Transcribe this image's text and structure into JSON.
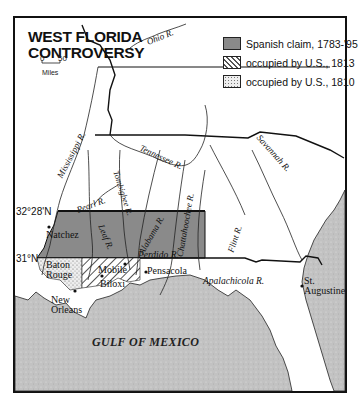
{
  "title": {
    "line1": "WEST FLORIDA",
    "line2": "CONTROVERSY"
  },
  "scale": {
    "zero": "0",
    "fifty": "50",
    "unit": "Miles"
  },
  "legend": [
    {
      "label": "Spanish claim, 1783-'95",
      "pattern": "solid-gray",
      "color": "#8a8a8a"
    },
    {
      "label": "occupied by U.S., 1813",
      "pattern": "diagonal-hatch",
      "color": "#ffffff"
    },
    {
      "label": "occupied by U.S., 1810",
      "pattern": "stipple",
      "color": "#e0e0e0"
    }
  ],
  "latitudes": [
    "32°28'N",
    "31°N"
  ],
  "rivers": [
    "Ohio R.",
    "Mississippi R.",
    "Tennessee R.",
    "Savannah R.",
    "Pearl R.",
    "Tombigbee R.",
    "Leaf R.",
    "Alabama R.",
    "Chattahoochee R.",
    "Flint R.",
    "Perdido R.",
    "Apalachicola R."
  ],
  "cities": [
    "Natchez",
    "Baton Rouge",
    "Mobile",
    "Biloxi",
    "Pensacola",
    "New Orleans",
    "St. Augustine"
  ],
  "water": {
    "gulf": "GULF OF MEXICO"
  },
  "colors": {
    "spanish_claim": "#8a8a8a",
    "water": "#c4c4c4",
    "border": "#111111"
  }
}
